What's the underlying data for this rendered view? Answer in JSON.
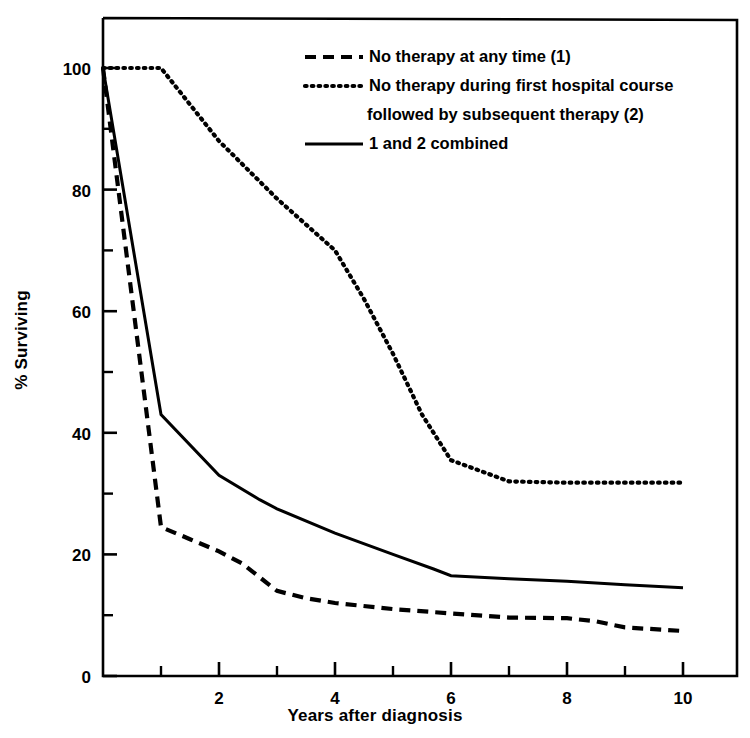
{
  "chart_data": {
    "type": "line",
    "title": "",
    "xlabel": "Years after diagnosis",
    "ylabel": "% Surviving",
    "xlim": [
      0,
      11
    ],
    "ylim": [
      0,
      105
    ],
    "grid": false,
    "legend_position": "top-center",
    "x_ticks_major": [
      2,
      4,
      6,
      8,
      10
    ],
    "x_ticks_minor": [
      1,
      3,
      5,
      7,
      9
    ],
    "x_tick_labels": [
      "2",
      "4",
      "6",
      "8",
      "10"
    ],
    "y_ticks_major": [
      0,
      20,
      40,
      60,
      80,
      100
    ],
    "y_ticks_minor": [
      10,
      30,
      50,
      70,
      90
    ],
    "y_tick_labels": [
      "0",
      "20",
      "40",
      "60",
      "80",
      "100"
    ],
    "series": [
      {
        "name": "No therapy at any time (1)",
        "style": "dashed",
        "color": "#000000",
        "x": [
          0,
          1,
          1.5,
          2,
          2.4,
          3,
          3.5,
          4,
          5,
          6,
          7,
          8,
          8.5,
          9,
          10
        ],
        "values": [
          100,
          24.5,
          22.5,
          20.5,
          18.5,
          14.0,
          12.8,
          12.0,
          11.0,
          10.3,
          9.6,
          9.5,
          9.0,
          8.0,
          7.4
        ]
      },
      {
        "name": "No therapy during first hospital course followed by subsequent therapy (2)",
        "style": "dotted",
        "color": "#000000",
        "x": [
          0,
          1,
          2,
          3,
          4,
          4.5,
          5,
          5.5,
          6,
          7,
          8,
          9,
          10
        ],
        "values": [
          100,
          100,
          88.0,
          78.5,
          70.0,
          62.0,
          53.0,
          43.0,
          35.5,
          32.0,
          31.8,
          31.8,
          31.8
        ]
      },
      {
        "name": "1 and 2 combined",
        "style": "solid",
        "color": "#000000",
        "x": [
          0,
          1,
          2,
          2.7,
          3,
          4,
          5,
          5.7,
          6,
          7,
          8,
          9,
          10
        ],
        "values": [
          100,
          43.0,
          33.0,
          29.0,
          27.5,
          23.5,
          20.0,
          17.6,
          16.5,
          16.0,
          15.6,
          15.0,
          14.5
        ]
      }
    ]
  },
  "legend": {
    "entries": [
      {
        "label": "No therapy at any time (1)",
        "style": "dashed"
      },
      {
        "label": "No therapy during first hospital course",
        "style": "dotted"
      },
      {
        "label": "followed by subsequent therapy (2)",
        "style": "none"
      },
      {
        "label": "1 and 2 combined",
        "style": "solid"
      }
    ]
  },
  "colors": {
    "ink": "#000000",
    "background": "#ffffff"
  }
}
